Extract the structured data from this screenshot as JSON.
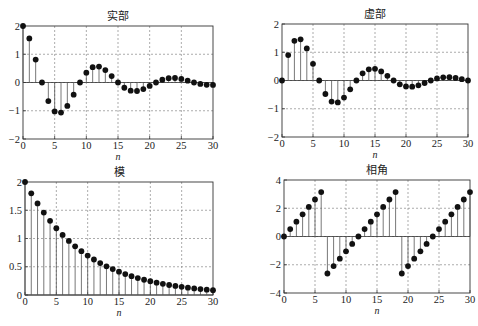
{
  "figure": {
    "width": 478,
    "height": 326,
    "marker_color": "#111111",
    "stem_color": "#555555",
    "grid_color": "#888888",
    "axis_color": "#333333"
  },
  "chart_data": [
    {
      "id": "real",
      "type": "stem",
      "title": "实部",
      "xlabel": "n",
      "ylabel": "",
      "xlim": [
        0,
        30
      ],
      "ylim": [
        -2,
        2
      ],
      "xticks": [
        0,
        5,
        10,
        15,
        20,
        25,
        30
      ],
      "yticks": [
        -2,
        -1,
        0,
        1,
        2
      ],
      "ytick_labels": [
        "−2",
        "−1",
        "0",
        "1",
        "2"
      ],
      "grid": true,
      "box": {
        "left": 23,
        "top": 26,
        "right": 213,
        "bottom": 139
      },
      "x": [
        0,
        1,
        2,
        3,
        4,
        5,
        6,
        7,
        8,
        9,
        10,
        11,
        12,
        13,
        14,
        15,
        16,
        17,
        18,
        19,
        20,
        21,
        22,
        23,
        24,
        25,
        26,
        27,
        28,
        29,
        30
      ],
      "values": [
        2.0,
        1.559,
        0.81,
        0.0,
        -0.656,
        -1.023,
        -1.063,
        -0.829,
        -0.43,
        0.0,
        0.349,
        0.544,
        0.565,
        0.44,
        0.229,
        0.0,
        -0.185,
        -0.289,
        -0.3,
        -0.234,
        -0.122,
        0.0,
        0.098,
        0.153,
        0.16,
        0.125,
        0.065,
        0.0,
        -0.052,
        -0.082,
        -0.085
      ]
    },
    {
      "id": "imag",
      "type": "stem",
      "title": "虚部",
      "xlabel": "n",
      "ylabel": "",
      "xlim": [
        0,
        30
      ],
      "ylim": [
        -2,
        2
      ],
      "xticks": [
        0,
        5,
        10,
        15,
        20,
        25,
        30
      ],
      "yticks": [
        -2,
        -1,
        0,
        1,
        2
      ],
      "ytick_labels": [
        "−2",
        "−1",
        "0",
        "1",
        "2"
      ],
      "grid": true,
      "box": {
        "left": 282,
        "top": 24,
        "right": 468,
        "bottom": 137
      },
      "x": [
        0,
        1,
        2,
        3,
        4,
        5,
        6,
        7,
        8,
        9,
        10,
        11,
        12,
        13,
        14,
        15,
        16,
        17,
        18,
        19,
        20,
        21,
        22,
        23,
        24,
        25,
        26,
        27,
        28,
        29,
        30
      ],
      "values": [
        0.0,
        0.9,
        1.403,
        1.458,
        1.136,
        0.59,
        0.0,
        -0.478,
        -0.746,
        -0.775,
        -0.604,
        -0.314,
        0.0,
        0.254,
        0.396,
        0.412,
        0.321,
        0.167,
        0.0,
        -0.135,
        -0.211,
        -0.219,
        -0.171,
        -0.089,
        0.0,
        0.072,
        0.112,
        0.116,
        0.091,
        0.047,
        0.0
      ]
    },
    {
      "id": "magnitude",
      "type": "stem",
      "title": "模",
      "xlabel": "n",
      "ylabel": "",
      "xlim": [
        0,
        30
      ],
      "ylim": [
        0,
        2
      ],
      "xticks": [
        0,
        5,
        10,
        15,
        20,
        25,
        30
      ],
      "yticks": [
        0,
        0.5,
        1,
        1.5,
        2
      ],
      "ytick_labels": [
        "0",
        "0.5",
        "1",
        "1.5",
        "2"
      ],
      "grid": true,
      "box": {
        "left": 25,
        "top": 182,
        "right": 213,
        "bottom": 295
      },
      "x": [
        0,
        1,
        2,
        3,
        4,
        5,
        6,
        7,
        8,
        9,
        10,
        11,
        12,
        13,
        14,
        15,
        16,
        17,
        18,
        19,
        20,
        21,
        22,
        23,
        24,
        25,
        26,
        27,
        28,
        29,
        30
      ],
      "values": [
        2.0,
        1.8,
        1.62,
        1.458,
        1.312,
        1.181,
        1.063,
        0.957,
        0.861,
        0.775,
        0.697,
        0.628,
        0.565,
        0.508,
        0.458,
        0.412,
        0.371,
        0.334,
        0.3,
        0.27,
        0.243,
        0.219,
        0.197,
        0.177,
        0.16,
        0.144,
        0.129,
        0.116,
        0.105,
        0.094,
        0.085
      ]
    },
    {
      "id": "phase",
      "type": "stem",
      "title": "相角",
      "xlabel": "n",
      "ylabel": "",
      "xlim": [
        0,
        30
      ],
      "ylim": [
        -4,
        4
      ],
      "xticks": [
        0,
        5,
        10,
        15,
        20,
        25,
        30
      ],
      "yticks": [
        -4,
        -2,
        0,
        2,
        4
      ],
      "ytick_labels": [
        "−4",
        "−2",
        "0",
        "2",
        "4"
      ],
      "grid": true,
      "box": {
        "left": 284,
        "top": 180,
        "right": 470,
        "bottom": 293
      },
      "x": [
        0,
        1,
        2,
        3,
        4,
        5,
        6,
        7,
        8,
        9,
        10,
        11,
        12,
        13,
        14,
        15,
        16,
        17,
        18,
        19,
        20,
        21,
        22,
        23,
        24,
        25,
        26,
        27,
        28,
        29,
        30
      ],
      "values": [
        0.0,
        0.524,
        1.047,
        1.571,
        2.094,
        2.618,
        3.142,
        -2.618,
        -2.094,
        -1.571,
        -1.047,
        -0.524,
        0.0,
        0.524,
        1.047,
        1.571,
        2.094,
        2.618,
        3.142,
        -2.618,
        -2.094,
        -1.571,
        -1.047,
        -0.524,
        0.0,
        0.524,
        1.047,
        1.571,
        2.094,
        2.618,
        3.142
      ]
    }
  ]
}
